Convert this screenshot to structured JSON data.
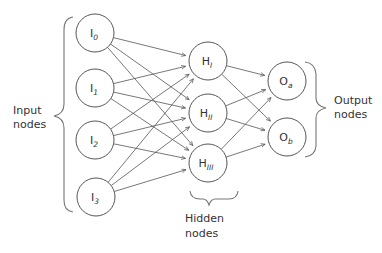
{
  "diagram": {
    "type": "neural-network",
    "layers": [
      {
        "id": "input",
        "label_line1": "Input",
        "label_line2": "nodes",
        "nodes": [
          {
            "id": "I0",
            "base": "I",
            "sub": "0",
            "cx": 95,
            "cy": 33
          },
          {
            "id": "I1",
            "base": "I",
            "sub": "1",
            "cx": 95,
            "cy": 88
          },
          {
            "id": "I2",
            "base": "I",
            "sub": "2",
            "cx": 95,
            "cy": 140
          },
          {
            "id": "I3",
            "base": "I",
            "sub": "3",
            "cx": 96,
            "cy": 197
          }
        ]
      },
      {
        "id": "hidden",
        "label_line1": "Hidden",
        "label_line2": "nodes",
        "nodes": [
          {
            "id": "HI",
            "base": "H",
            "sub": "I",
            "cx": 208,
            "cy": 61
          },
          {
            "id": "HII",
            "base": "H",
            "sub": "II",
            "cx": 208,
            "cy": 113
          },
          {
            "id": "HIII",
            "base": "H",
            "sub": "III",
            "cx": 208,
            "cy": 163
          }
        ]
      },
      {
        "id": "output",
        "label_line1": "Output",
        "label_line2": "nodes",
        "nodes": [
          {
            "id": "Oa",
            "base": "O",
            "sub": "a",
            "cx": 287,
            "cy": 81
          },
          {
            "id": "Ob",
            "base": "O",
            "sub": "b",
            "cx": 287,
            "cy": 137
          }
        ]
      }
    ],
    "node_radius": 19,
    "connections": "fully-connected input→hidden, hidden→output, arrow direction left to right",
    "colors": {
      "stroke": "#555555",
      "brace": "#777777",
      "text": "#333333",
      "background": "#ffffff"
    }
  }
}
